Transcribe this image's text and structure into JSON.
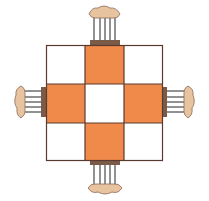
{
  "figure": {
    "grid": {
      "rows": 3,
      "cols": 3,
      "cells": [
        [
          "white",
          "orange",
          "white"
        ],
        [
          "orange",
          "white",
          "orange"
        ],
        [
          "white",
          "orange",
          "white"
        ]
      ]
    },
    "colors": {
      "orange": "#f08a4b",
      "white": "#ffffff",
      "grid_line": "#5a3a2e",
      "chair_seat": "#e8c3a0",
      "chair_back": "#7a5a48",
      "chair_spindle": "#6e6e6e"
    },
    "chairs": [
      "top",
      "bottom",
      "left",
      "right"
    ]
  }
}
